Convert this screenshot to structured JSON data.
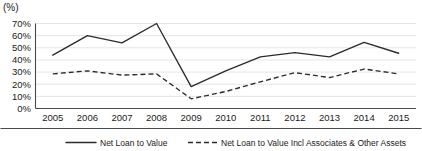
{
  "chart_data": {
    "type": "line",
    "title": "",
    "unit_label": "(%)",
    "xlabel": "",
    "ylabel": "",
    "ylim": [
      0,
      70
    ],
    "ytick_step": 10,
    "ytick_labels": [
      "0%",
      "10%",
      "20%",
      "30%",
      "40%",
      "50%",
      "60%",
      "70%"
    ],
    "grid": true,
    "legend_position": "bottom",
    "categories": [
      "2005",
      "2006",
      "2007",
      "2008",
      "2009",
      "2010",
      "2011",
      "2012",
      "2013",
      "2014",
      "2015"
    ],
    "series": [
      {
        "name": "Net Loan to Value",
        "style": "solid",
        "color": "#2b2b2b",
        "values": [
          44,
          60,
          54,
          70,
          18,
          31,
          42.5,
          46,
          42.5,
          54.5,
          45.5
        ]
      },
      {
        "name": "Net Loan to Value Incl Associates & Other Assets",
        "style": "dashed",
        "color": "#2b2b2b",
        "values": [
          28.5,
          31,
          27.5,
          28.5,
          8,
          14,
          22,
          29.5,
          25.5,
          32.5,
          28.5
        ]
      }
    ]
  },
  "legend": {
    "items": [
      {
        "label": "Net Loan to Value",
        "style": "solid"
      },
      {
        "label": "Net Loan to Value Incl Associates & Other Assets",
        "style": "dashed"
      }
    ]
  }
}
